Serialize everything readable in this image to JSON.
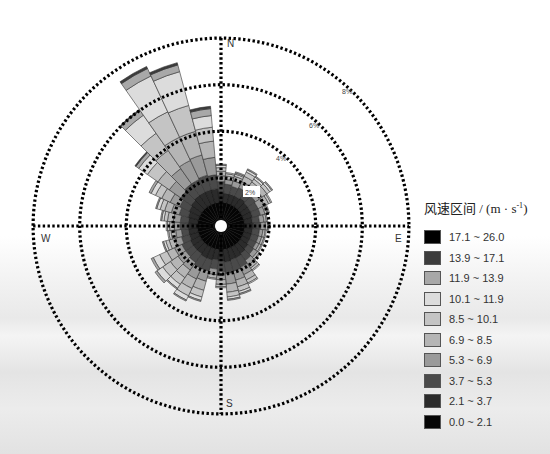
{
  "chart_data": {
    "type": "wind-rose",
    "title": "",
    "legend_title": "风速区间 / (m · s⁻¹)",
    "legend_title_parts": {
      "main": "风速区间 / (m · s",
      "sup": "-1",
      "end": ")"
    },
    "legend_position": "right",
    "compass_labels": {
      "N": "N",
      "E": "E",
      "S": "S",
      "W": "W"
    },
    "radial_ticks": [
      {
        "value": 2,
        "label": "2%"
      },
      {
        "value": 4,
        "label": "4%"
      },
      {
        "value": 6,
        "label": "6%"
      },
      {
        "value": 8,
        "label": "8%"
      }
    ],
    "radial_max": 8,
    "grid": "dotted",
    "bins": [
      {
        "label": "0.0 ~ 2.1",
        "color": "#050505"
      },
      {
        "label": "2.1 ~ 3.7",
        "color": "#2b2b2b"
      },
      {
        "label": "3.7 ~ 5.3",
        "color": "#4a4a4a"
      },
      {
        "label": "5.3 ~ 6.9",
        "color": "#9a9a9a"
      },
      {
        "label": "6.9 ~ 8.5",
        "color": "#b5b5b5"
      },
      {
        "label": "8.5 ~ 10.1",
        "color": "#c4c4c4"
      },
      {
        "label": "10.1 ~ 11.9",
        "color": "#dcdcdc"
      },
      {
        "label": "11.9 ~ 13.9",
        "color": "#a8a8a8"
      },
      {
        "label": "13.9 ~ 17.1",
        "color": "#3c3c3c"
      },
      {
        "label": "17.1 ~ 26.0",
        "color": "#000000"
      }
    ],
    "directions_deg": [
      0,
      10,
      20,
      30,
      40,
      50,
      60,
      70,
      80,
      90,
      100,
      110,
      120,
      130,
      140,
      150,
      160,
      170,
      180,
      190,
      200,
      210,
      220,
      230,
      240,
      250,
      260,
      270,
      280,
      290,
      300,
      310,
      320,
      330,
      340,
      350
    ],
    "series": [
      {
        "dir": 0,
        "values": [
          0.75,
          0.45,
          0.45,
          0.25,
          0.2,
          0.15,
          0.1,
          0.05,
          0.0,
          0.0
        ]
      },
      {
        "dir": 10,
        "values": [
          0.75,
          0.4,
          0.4,
          0.2,
          0.15,
          0.1,
          0.05,
          0.0,
          0.0,
          0.0
        ]
      },
      {
        "dir": 20,
        "values": [
          0.75,
          0.4,
          0.35,
          0.25,
          0.2,
          0.1,
          0.05,
          0.05,
          0.0,
          0.0
        ]
      },
      {
        "dir": 30,
        "values": [
          0.75,
          0.4,
          0.4,
          0.3,
          0.25,
          0.2,
          0.1,
          0.05,
          0.0,
          0.0
        ]
      },
      {
        "dir": 40,
        "values": [
          0.75,
          0.45,
          0.35,
          0.3,
          0.2,
          0.15,
          0.1,
          0.05,
          0.0,
          0.0
        ]
      },
      {
        "dir": 50,
        "values": [
          0.75,
          0.4,
          0.4,
          0.35,
          0.25,
          0.15,
          0.1,
          0.05,
          0.0,
          0.0
        ]
      },
      {
        "dir": 60,
        "values": [
          0.75,
          0.4,
          0.35,
          0.3,
          0.2,
          0.1,
          0.05,
          0.0,
          0.0,
          0.0
        ]
      },
      {
        "dir": 70,
        "values": [
          0.75,
          0.4,
          0.35,
          0.2,
          0.1,
          0.05,
          0.05,
          0.0,
          0.0,
          0.0
        ]
      },
      {
        "dir": 80,
        "values": [
          0.75,
          0.35,
          0.3,
          0.2,
          0.1,
          0.05,
          0.0,
          0.0,
          0.0,
          0.0
        ]
      },
      {
        "dir": 90,
        "values": [
          0.75,
          0.4,
          0.3,
          0.2,
          0.1,
          0.05,
          0.0,
          0.0,
          0.0,
          0.0
        ]
      },
      {
        "dir": 100,
        "values": [
          0.75,
          0.35,
          0.3,
          0.15,
          0.1,
          0.05,
          0.0,
          0.0,
          0.0,
          0.0
        ]
      },
      {
        "dir": 110,
        "values": [
          0.75,
          0.35,
          0.3,
          0.15,
          0.1,
          0.05,
          0.0,
          0.0,
          0.0,
          0.0
        ]
      },
      {
        "dir": 120,
        "values": [
          0.75,
          0.35,
          0.3,
          0.15,
          0.1,
          0.05,
          0.0,
          0.0,
          0.0,
          0.0
        ]
      },
      {
        "dir": 130,
        "values": [
          0.75,
          0.4,
          0.3,
          0.2,
          0.1,
          0.05,
          0.0,
          0.0,
          0.0,
          0.0
        ]
      },
      {
        "dir": 140,
        "values": [
          0.75,
          0.45,
          0.35,
          0.25,
          0.15,
          0.1,
          0.05,
          0.0,
          0.0,
          0.0
        ]
      },
      {
        "dir": 150,
        "values": [
          0.75,
          0.5,
          0.45,
          0.35,
          0.25,
          0.15,
          0.05,
          0.0,
          0.0,
          0.0
        ]
      },
      {
        "dir": 160,
        "values": [
          0.75,
          0.5,
          0.5,
          0.4,
          0.3,
          0.2,
          0.1,
          0.05,
          0.0,
          0.0
        ]
      },
      {
        "dir": 170,
        "values": [
          0.75,
          0.55,
          0.5,
          0.45,
          0.35,
          0.2,
          0.1,
          0.05,
          0.0,
          0.0
        ]
      },
      {
        "dir": 180,
        "values": [
          0.75,
          0.5,
          0.45,
          0.35,
          0.2,
          0.1,
          0.05,
          0.0,
          0.0,
          0.0
        ]
      },
      {
        "dir": 190,
        "values": [
          0.75,
          0.45,
          0.4,
          0.25,
          0.15,
          0.05,
          0.0,
          0.0,
          0.0,
          0.0
        ]
      },
      {
        "dir": 200,
        "values": [
          0.75,
          0.5,
          0.5,
          0.45,
          0.4,
          0.3,
          0.15,
          0.05,
          0.0,
          0.0
        ]
      },
      {
        "dir": 210,
        "values": [
          0.75,
          0.5,
          0.5,
          0.5,
          0.45,
          0.35,
          0.2,
          0.05,
          0.0,
          0.0
        ]
      },
      {
        "dir": 220,
        "values": [
          0.75,
          0.45,
          0.45,
          0.4,
          0.4,
          0.35,
          0.2,
          0.05,
          0.0,
          0.0
        ]
      },
      {
        "dir": 230,
        "values": [
          0.75,
          0.45,
          0.4,
          0.4,
          0.4,
          0.4,
          0.3,
          0.1,
          0.0,
          0.0
        ]
      },
      {
        "dir": 240,
        "values": [
          0.75,
          0.45,
          0.4,
          0.35,
          0.35,
          0.35,
          0.3,
          0.1,
          0.0,
          0.0
        ]
      },
      {
        "dir": 250,
        "values": [
          0.75,
          0.4,
          0.35,
          0.3,
          0.25,
          0.15,
          0.1,
          0.05,
          0.0,
          0.0
        ]
      },
      {
        "dir": 260,
        "values": [
          0.75,
          0.4,
          0.3,
          0.25,
          0.2,
          0.1,
          0.05,
          0.0,
          0.0,
          0.0
        ]
      },
      {
        "dir": 270,
        "values": [
          0.75,
          0.4,
          0.35,
          0.25,
          0.2,
          0.1,
          0.05,
          0.0,
          0.0,
          0.0
        ]
      },
      {
        "dir": 280,
        "values": [
          0.75,
          0.4,
          0.35,
          0.3,
          0.25,
          0.15,
          0.1,
          0.05,
          0.0,
          0.0
        ]
      },
      {
        "dir": 290,
        "values": [
          0.75,
          0.45,
          0.4,
          0.35,
          0.3,
          0.2,
          0.15,
          0.05,
          0.0,
          0.0
        ]
      },
      {
        "dir": 300,
        "values": [
          0.75,
          0.5,
          0.45,
          0.45,
          0.4,
          0.3,
          0.2,
          0.1,
          0.0,
          0.0
        ]
      },
      {
        "dir": 310,
        "values": [
          0.75,
          0.55,
          0.55,
          0.6,
          0.6,
          0.55,
          0.45,
          0.15,
          0.05,
          0.0
        ]
      },
      {
        "dir": 320,
        "values": [
          0.75,
          0.6,
          0.6,
          0.8,
          0.95,
          0.9,
          0.95,
          0.25,
          0.05,
          0.0
        ]
      },
      {
        "dir": 330,
        "values": [
          0.75,
          0.6,
          0.6,
          0.9,
          1.1,
          1.2,
          1.7,
          0.35,
          0.1,
          0.0
        ]
      },
      {
        "dir": 340,
        "values": [
          0.75,
          0.6,
          0.65,
          0.9,
          1.05,
          1.15,
          1.5,
          0.3,
          0.1,
          0.0
        ]
      },
      {
        "dir": 350,
        "values": [
          0.75,
          0.6,
          0.6,
          0.75,
          0.7,
          0.6,
          0.5,
          0.3,
          0.1,
          0.0
        ]
      }
    ],
    "xlabel": "",
    "ylabel": ""
  }
}
